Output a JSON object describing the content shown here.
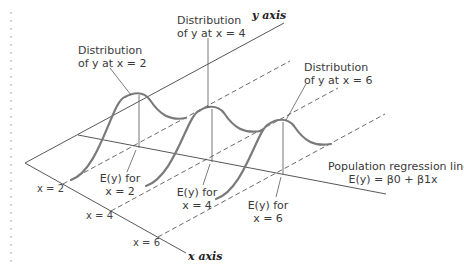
{
  "diagram": {
    "title": "",
    "axes": {
      "y_axis_label": "y axis",
      "x_axis_label": "x axis",
      "x_ticks": [
        "x = 2",
        "x = 4",
        "x = 6"
      ]
    },
    "distributions": [
      {
        "line1": "Distribution",
        "line2": "of y at x = 2",
        "ey_line1": "E(y) for",
        "ey_line2": "x = 2"
      },
      {
        "line1": "Distribution",
        "line2": "of y at x = 4",
        "ey_line1": "E(y) for",
        "ey_line2": "x = 4"
      },
      {
        "line1": "Distribution",
        "line2": "of y at x = 6",
        "ey_line1": "E(y) for",
        "ey_line2": "x = 6"
      }
    ],
    "regression": {
      "label": "Population regression line",
      "equation": "E(y) = β0 + β1x"
    },
    "colors": {
      "curve": "#7a7a7a",
      "line": "#444444",
      "dots": "#c8c8c8"
    }
  }
}
